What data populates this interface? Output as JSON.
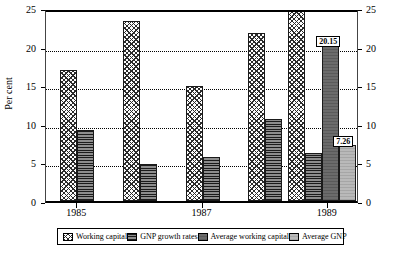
{
  "chart_data": {
    "type": "bar",
    "title": "",
    "xlabel": "",
    "ylabel": "Per cent",
    "ylim": [
      0,
      25
    ],
    "ytick_labels": [
      "0",
      "5",
      "10",
      "15",
      "20",
      "25"
    ],
    "ytick_values": [
      0,
      5,
      10,
      15,
      20,
      25
    ],
    "right_axis": true,
    "right_ytick_labels": [
      "0",
      "5",
      "10",
      "15",
      "20",
      "25"
    ],
    "grid": "horizontal-dotted",
    "legend_position": "bottom",
    "categories": [
      "1985",
      "1986",
      "1987",
      "1988",
      "1989"
    ],
    "xtick_labels": [
      "1985",
      "1987",
      "1989"
    ],
    "series": [
      {
        "name": "Working capital",
        "pattern": "diagonal-cross-hatch",
        "values": [
          17.0,
          23.3,
          14.9,
          21.8,
          25.0
        ]
      },
      {
        "name": "GNP growth rates",
        "pattern": "horizontal-stripes",
        "values": [
          9.2,
          4.8,
          5.7,
          10.6,
          6.2
        ]
      },
      {
        "name": "Average working capital",
        "pattern": "solid-dark-grey",
        "values": [
          null,
          null,
          null,
          null,
          20.15
        ]
      },
      {
        "name": "Average GNP",
        "pattern": "solid-light-grey",
        "values": [
          null,
          null,
          null,
          null,
          7.26
        ]
      }
    ],
    "annotations": [
      {
        "text": "20.15",
        "series": "Average working capital",
        "category": "1989"
      },
      {
        "text": "7.26",
        "series": "Average GNP",
        "category": "1989"
      }
    ]
  },
  "legend": {
    "items": [
      {
        "label": "Working capital"
      },
      {
        "label": "GNP growth rates"
      },
      {
        "label": "Average working capital"
      },
      {
        "label": "Average GNP"
      }
    ]
  }
}
